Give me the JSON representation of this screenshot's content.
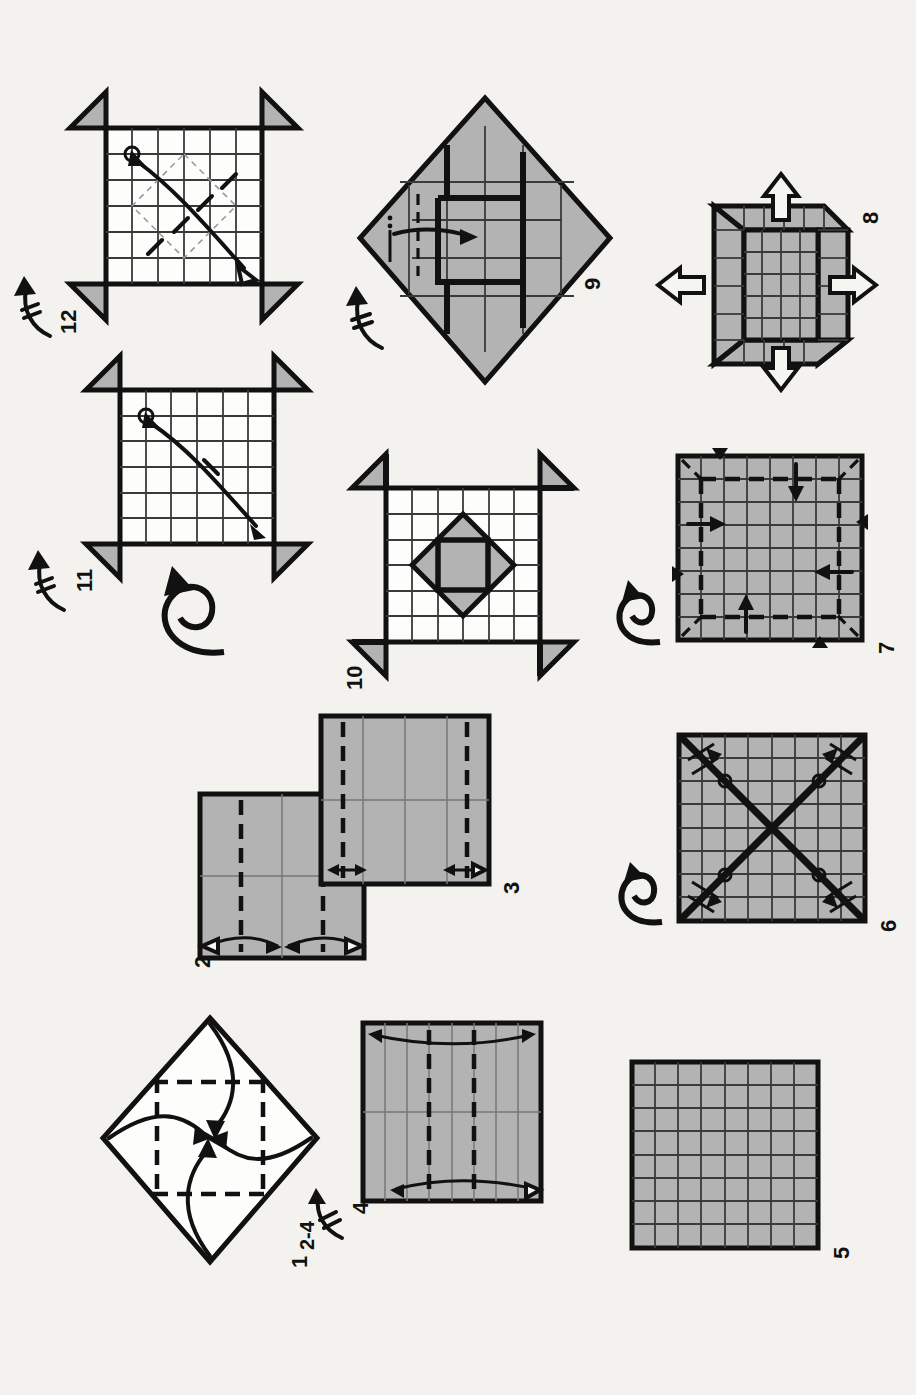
{
  "document": {
    "kind": "origami-folding-diagram",
    "orientation": "landscape-content-on-portrait-page",
    "background_color": "#f3f2ef",
    "paper_front_color": "#b3b3b3",
    "paper_back_color": "#fdfdfc",
    "ink_color": "#111111",
    "total_steps": 12
  },
  "steps": [
    {
      "number": "1",
      "label": "1",
      "shape": "diamond",
      "paper_side": "white",
      "description": "Square rotated 45 degrees with dashed quarter fold lines; four curved arrows fold each corner to the center.",
      "creases": "two horizontal and two vertical dashed lines at quarter divisions",
      "arrows": 4,
      "arrow_style": "curved solid, single head, pointing to center"
    },
    {
      "number": "2",
      "label": "2",
      "shape": "square",
      "paper_side": "gray",
      "description": "Gray square with two vertical dashed valley folds at quarter positions and a pair of curved double-headed arrows at the bottom edge.",
      "grid": "2 x 2 light creases",
      "dashes": 2,
      "arrows": 2,
      "arrow_style": "curved double-headed with hollow head"
    },
    {
      "number": "3",
      "label": "3",
      "shape": "square",
      "paper_side": "gray",
      "description": "Gray square now showing 4 vertical divisions; dashed folds at the outer eighths with small double-headed arrows at the bottom corners.",
      "grid": "4 x 2 light creases",
      "dashes": 2,
      "arrows": 2,
      "arrow_style": "short straight double-headed"
    },
    {
      "number": "4",
      "label": "4",
      "repeat_label": "2-4",
      "shape": "square",
      "paper_side": "gray",
      "description": "Gray square with 8 vertical creases; two dashed folds and curved double-headed arrows at top and bottom. Repeat steps 2 through 4 on the other axis.",
      "grid": "8 x 2 light creases",
      "dashes": 2,
      "arrows": 2,
      "arrow_style": "curved double-headed"
    },
    {
      "number": "5",
      "label": "5",
      "shape": "square",
      "paper_side": "gray",
      "description": "Completed 8 by 8 grid of creases on the gray side.",
      "grid": "8 x 8 creases",
      "dashes": 0,
      "arrows": 0
    },
    {
      "number": "6",
      "label": "6",
      "shape": "square",
      "paper_side": "gray",
      "description": "8 by 8 grid with both bold diagonals creased; circle reference marks and short arrows along each diagonal. Turn over symbol at left.",
      "grid": "8 x 8 creases",
      "diagonals": 2,
      "reference_circles": 4,
      "arrows": 8,
      "turn_over": true
    },
    {
      "number": "7",
      "label": "7",
      "shape": "square",
      "paper_side": "gray",
      "description": "Grid square with dashed box folds, straight arrows pushing inward on four sides, solid black triangle index markers on the edges, and a turn over symbol.",
      "grid": "8 x 8 creases",
      "arrows": 4,
      "edge_markers": 4,
      "turn_over": true
    },
    {
      "number": "8",
      "label": "8",
      "shape": "three-dimensional",
      "paper_side": "gray",
      "description": "Three dimensional pinwheel box form with four raised walls; four large hollow outline arrows point outward, indicating the flaps are pulled open.",
      "hollow_arrows": 4
    },
    {
      "number": "9",
      "label": "9",
      "shape": "diamond",
      "paper_side": "gray",
      "description": "Flattened form seen as a diamond with an interlocked pinwheel of gridded panels; a straight arrow tucks the left flap inward and a repeat hook arrow sits at lower left.",
      "arrows": 1,
      "repeat_marker": true
    },
    {
      "number": "10",
      "label": "10",
      "shape": "square-with-flaps",
      "paper_side": "white",
      "description": "White gridded square with four gray pinwheel corner flaps and a central gray diamond-in-square motif.",
      "grid": "6 x 6 creases",
      "corner_flaps": 4
    },
    {
      "number": "11",
      "label": "11",
      "shape": "square-with-flaps",
      "paper_side": "white",
      "description": "White gridded square with pinwheel flaps; a circle reference mark at upper left and a long curved double-headed diagonal arrow with a single tick (fold once) mark. Turn over symbol below.",
      "grid": "6 x 6 creases",
      "reference_circles": 1,
      "tick_marks": 1,
      "repeat_marker": true,
      "turn_over": true
    },
    {
      "number": "12",
      "label": "12",
      "shape": "square-with-flaps",
      "paper_side": "white",
      "description": "White gridded square with pinwheel flaps; circle reference mark, curved double-headed diagonal arrow, a thin dashed diamond guide, and four short diagonal tick marks indicating repeated creases.",
      "grid": "6 x 6 creases",
      "reference_circles": 1,
      "tick_marks": 4,
      "guide_diamond": true,
      "repeat_marker": true
    }
  ],
  "symbols": {
    "turn_over": "looping arrow with circular tail",
    "repeat": "arrow with cross-hatch bar",
    "valley_fold": "dashed line",
    "reference_point": "small open circle",
    "push_open": "hollow outline arrow",
    "index_marker": "solid black triangle"
  }
}
